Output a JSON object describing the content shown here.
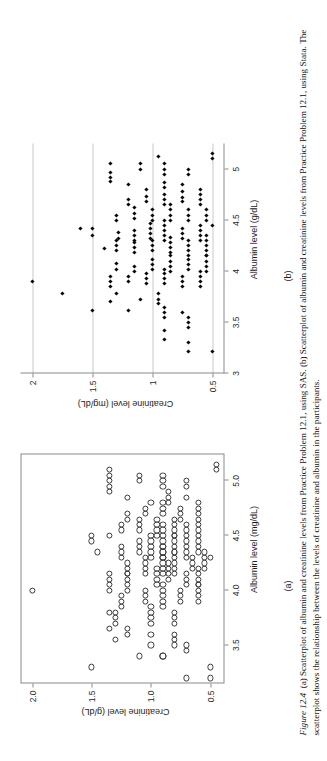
{
  "figure": {
    "number_label": "Figure 12.4",
    "caption_part_a": "(a) Scatterplot of albumin and creatinine levels from Practice Problem 12.1, using SAS.",
    "caption_part_b": "(b) Scatterplot of albumin and creatinine levels from Practice Problem 12.1, using Stata.",
    "caption_note": "The scatterplot shows the relationship between the levels of creatinine and albumin in the participants.",
    "sublabel_a": "(a)",
    "sublabel_b": "(b)"
  },
  "chart_data": [
    {
      "id": "panel-a",
      "type": "scatter",
      "software": "SAS",
      "title": "",
      "xlabel": "Albumin level (mg/dL)",
      "ylabel": "Creatinine level (g/dL)",
      "xlim": [
        3.15,
        5.25
      ],
      "ylim": [
        0.38,
        2.1
      ],
      "xticks": [
        3.5,
        4.0,
        4.5,
        5.0
      ],
      "xticklabels": [
        "3.5",
        "4.0",
        "4.5",
        "5.0"
      ],
      "yticks": [
        0.5,
        1.0,
        1.5,
        2.0
      ],
      "yticklabels": [
        "0.5",
        "1.0",
        "1.5",
        "2.0"
      ],
      "grid": false,
      "frame": "box",
      "marker": "open-circle",
      "legend": "none",
      "points": [
        [
          3.2,
          0.5
        ],
        [
          3.3,
          0.5
        ],
        [
          3.2,
          0.7
        ],
        [
          3.4,
          0.9
        ],
        [
          3.4,
          0.9
        ],
        [
          3.45,
          0.7
        ],
        [
          3.5,
          0.7
        ],
        [
          3.3,
          1.5
        ],
        [
          3.4,
          1.1
        ],
        [
          3.5,
          0.8
        ],
        [
          3.55,
          0.8
        ],
        [
          3.6,
          0.8
        ],
        [
          3.5,
          1.0
        ],
        [
          3.6,
          1.0
        ],
        [
          3.6,
          1.2
        ],
        [
          3.65,
          1.2
        ],
        [
          3.55,
          1.3
        ],
        [
          3.7,
          0.8
        ],
        [
          3.75,
          0.8
        ],
        [
          3.8,
          0.8
        ],
        [
          3.7,
          1.0
        ],
        [
          3.75,
          1.0
        ],
        [
          3.8,
          1.0
        ],
        [
          3.85,
          1.0
        ],
        [
          3.7,
          1.3
        ],
        [
          3.75,
          1.3
        ],
        [
          3.8,
          1.3
        ],
        [
          3.65,
          1.35
        ],
        [
          3.9,
          0.6
        ],
        [
          3.95,
          0.6
        ],
        [
          4.0,
          0.6
        ],
        [
          4.05,
          0.6
        ],
        [
          3.9,
          0.75
        ],
        [
          3.95,
          0.75
        ],
        [
          4.0,
          0.75
        ],
        [
          3.85,
          0.9
        ],
        [
          3.9,
          0.9
        ],
        [
          3.95,
          0.9
        ],
        [
          4.0,
          0.9
        ],
        [
          4.05,
          0.9
        ],
        [
          3.9,
          1.05
        ],
        [
          3.95,
          1.05
        ],
        [
          4.0,
          1.05
        ],
        [
          3.85,
          1.25
        ],
        [
          3.9,
          1.25
        ],
        [
          3.95,
          1.25
        ],
        [
          3.8,
          1.35
        ],
        [
          4.0,
          2.0
        ],
        [
          4.05,
          0.6
        ],
        [
          4.1,
          0.6
        ],
        [
          4.15,
          0.6
        ],
        [
          4.2,
          0.6
        ],
        [
          4.05,
          0.7
        ],
        [
          4.1,
          0.7
        ],
        [
          4.15,
          0.7
        ],
        [
          4.1,
          0.85
        ],
        [
          4.15,
          0.85
        ],
        [
          4.2,
          0.85
        ],
        [
          4.25,
          0.85
        ],
        [
          4.05,
          0.95
        ],
        [
          4.1,
          0.95
        ],
        [
          4.15,
          0.95
        ],
        [
          4.2,
          0.95
        ],
        [
          4.0,
          1.2
        ],
        [
          4.05,
          1.2
        ],
        [
          4.1,
          1.2
        ],
        [
          4.15,
          1.2
        ],
        [
          4.0,
          1.35
        ],
        [
          4.05,
          1.35
        ],
        [
          4.2,
          0.55
        ],
        [
          4.25,
          0.55
        ],
        [
          4.3,
          0.55
        ],
        [
          4.35,
          0.55
        ],
        [
          4.2,
          0.65
        ],
        [
          4.25,
          0.65
        ],
        [
          4.3,
          0.65
        ],
        [
          4.15,
          0.8
        ],
        [
          4.2,
          0.8
        ],
        [
          4.25,
          0.8
        ],
        [
          4.3,
          0.8
        ],
        [
          4.35,
          0.8
        ],
        [
          4.15,
          0.9
        ],
        [
          4.2,
          0.9
        ],
        [
          4.25,
          0.9
        ],
        [
          4.3,
          0.9
        ],
        [
          4.35,
          0.9
        ],
        [
          4.4,
          0.9
        ],
        [
          4.15,
          1.05
        ],
        [
          4.2,
          1.05
        ],
        [
          4.25,
          1.05
        ],
        [
          4.3,
          1.05
        ],
        [
          4.15,
          1.2
        ],
        [
          4.2,
          1.2
        ],
        [
          4.25,
          1.2
        ],
        [
          4.1,
          1.35
        ],
        [
          4.15,
          1.35
        ],
        [
          4.3,
          0.5
        ],
        [
          4.35,
          0.6
        ],
        [
          4.4,
          0.6
        ],
        [
          4.45,
          0.6
        ],
        [
          4.3,
          0.7
        ],
        [
          4.35,
          0.7
        ],
        [
          4.4,
          0.7
        ],
        [
          4.45,
          0.7
        ],
        [
          4.35,
          0.8
        ],
        [
          4.4,
          0.8
        ],
        [
          4.45,
          0.8
        ],
        [
          4.5,
          0.8
        ],
        [
          4.3,
          0.9
        ],
        [
          4.35,
          0.9
        ],
        [
          4.4,
          0.9
        ],
        [
          4.45,
          0.9
        ],
        [
          4.5,
          0.9
        ],
        [
          4.55,
          0.9
        ],
        [
          4.6,
          0.9
        ],
        [
          4.3,
          1.0
        ],
        [
          4.35,
          1.0
        ],
        [
          4.4,
          1.0
        ],
        [
          4.45,
          1.0
        ],
        [
          4.5,
          1.0
        ],
        [
          4.35,
          1.1
        ],
        [
          4.4,
          1.1
        ],
        [
          4.45,
          1.1
        ],
        [
          4.3,
          1.25
        ],
        [
          4.35,
          1.25
        ],
        [
          4.4,
          1.25
        ],
        [
          4.35,
          1.45
        ],
        [
          4.45,
          1.5
        ],
        [
          4.5,
          1.5
        ],
        [
          4.5,
          0.6
        ],
        [
          4.55,
          0.6
        ],
        [
          4.6,
          0.6
        ],
        [
          4.5,
          0.7
        ],
        [
          4.55,
          0.7
        ],
        [
          4.6,
          0.7
        ],
        [
          4.5,
          0.8
        ],
        [
          4.55,
          0.8
        ],
        [
          4.6,
          0.8
        ],
        [
          4.65,
          0.8
        ],
        [
          4.5,
          0.95
        ],
        [
          4.55,
          0.95
        ],
        [
          4.6,
          0.95
        ],
        [
          4.65,
          0.95
        ],
        [
          4.55,
          1.1
        ],
        [
          4.6,
          1.1
        ],
        [
          4.65,
          1.1
        ],
        [
          4.55,
          1.25
        ],
        [
          4.6,
          1.25
        ],
        [
          4.5,
          1.35
        ],
        [
          4.65,
          0.6
        ],
        [
          4.7,
          0.6
        ],
        [
          4.75,
          0.6
        ],
        [
          4.65,
          0.75
        ],
        [
          4.7,
          0.75
        ],
        [
          4.75,
          0.75
        ],
        [
          4.7,
          0.9
        ],
        [
          4.75,
          0.9
        ],
        [
          4.8,
          0.9
        ],
        [
          4.7,
          1.05
        ],
        [
          4.75,
          1.05
        ],
        [
          4.65,
          1.2
        ],
        [
          4.7,
          1.2
        ],
        [
          4.8,
          0.6
        ],
        [
          4.85,
          0.7
        ],
        [
          4.8,
          0.85
        ],
        [
          4.85,
          0.85
        ],
        [
          4.9,
          0.85
        ],
        [
          4.8,
          1.0
        ],
        [
          4.85,
          1.2
        ],
        [
          4.9,
          1.35
        ],
        [
          4.95,
          1.35
        ],
        [
          5.0,
          1.35
        ],
        [
          4.95,
          0.7
        ],
        [
          5.0,
          0.7
        ],
        [
          4.95,
          0.9
        ],
        [
          5.0,
          0.9
        ],
        [
          5.05,
          0.9
        ],
        [
          5.0,
          1.1
        ],
        [
          5.05,
          1.1
        ],
        [
          5.1,
          0.45
        ],
        [
          5.15,
          0.45
        ],
        [
          5.1,
          1.35
        ],
        [
          5.05,
          1.35
        ]
      ]
    },
    {
      "id": "panel-b",
      "type": "scatter",
      "software": "Stata",
      "title": "",
      "xlabel": "Albumin level (g/dL)",
      "ylabel": "Creatinine level (mg/dL)",
      "xlim": [
        3.0,
        5.25
      ],
      "ylim": [
        0.4,
        2.1
      ],
      "xticks": [
        3,
        3.5,
        4,
        4.5,
        5
      ],
      "xticklabels": [
        "3",
        "3.5",
        "4",
        "4.5",
        "5"
      ],
      "yticks": [
        0.5,
        1,
        1.5,
        2
      ],
      "yticklabels": [
        "0.5",
        "1",
        "1.5",
        "2"
      ],
      "grid": true,
      "grid_orientation": "horizontal",
      "frame": "left-bottom",
      "marker": "filled-diamond",
      "legend": "none",
      "points": [
        [
          3.22,
          0.5
        ],
        [
          3.3,
          0.7
        ],
        [
          3.22,
          0.7
        ],
        [
          3.33,
          0.9
        ],
        [
          3.45,
          0.7
        ],
        [
          3.5,
          0.7
        ],
        [
          3.55,
          0.7
        ],
        [
          3.42,
          0.9
        ],
        [
          3.55,
          0.9
        ],
        [
          3.6,
          0.9
        ],
        [
          3.65,
          0.9
        ],
        [
          3.6,
          0.75
        ],
        [
          3.62,
          1.2
        ],
        [
          3.7,
          1.35
        ],
        [
          3.62,
          1.5
        ],
        [
          3.68,
          0.95
        ],
        [
          3.72,
          0.95
        ],
        [
          3.78,
          0.95
        ],
        [
          3.72,
          1.1
        ],
        [
          3.78,
          1.3
        ],
        [
          3.85,
          0.6
        ],
        [
          3.9,
          0.6
        ],
        [
          3.95,
          0.6
        ],
        [
          4.0,
          0.6
        ],
        [
          3.85,
          0.75
        ],
        [
          3.9,
          0.75
        ],
        [
          3.95,
          0.75
        ],
        [
          3.88,
          0.9
        ],
        [
          3.93,
          0.9
        ],
        [
          3.98,
          0.9
        ],
        [
          4.02,
          0.9
        ],
        [
          3.88,
          1.05
        ],
        [
          3.93,
          1.05
        ],
        [
          3.98,
          1.05
        ],
        [
          3.9,
          1.2
        ],
        [
          3.95,
          1.2
        ],
        [
          3.85,
          1.35
        ],
        [
          3.9,
          1.35
        ],
        [
          3.95,
          1.35
        ],
        [
          3.9,
          2.0
        ],
        [
          3.78,
          1.75
        ],
        [
          4.0,
          0.55
        ],
        [
          4.05,
          0.55
        ],
        [
          4.1,
          0.55
        ],
        [
          4.15,
          0.55
        ],
        [
          4.02,
          0.7
        ],
        [
          4.07,
          0.7
        ],
        [
          4.12,
          0.7
        ],
        [
          4.0,
          0.85
        ],
        [
          4.05,
          0.85
        ],
        [
          4.1,
          0.85
        ],
        [
          4.15,
          0.85
        ],
        [
          4.02,
          1.0
        ],
        [
          4.07,
          1.0
        ],
        [
          4.12,
          1.0
        ],
        [
          4.0,
          1.15
        ],
        [
          4.05,
          1.15
        ],
        [
          4.02,
          1.3
        ],
        [
          4.08,
          1.3
        ],
        [
          4.15,
          0.55
        ],
        [
          4.2,
          0.55
        ],
        [
          4.25,
          0.55
        ],
        [
          4.3,
          0.55
        ],
        [
          4.35,
          0.55
        ],
        [
          4.15,
          0.7
        ],
        [
          4.2,
          0.7
        ],
        [
          4.25,
          0.7
        ],
        [
          4.3,
          0.7
        ],
        [
          4.18,
          0.85
        ],
        [
          4.23,
          0.85
        ],
        [
          4.28,
          0.85
        ],
        [
          4.33,
          0.85
        ],
        [
          4.2,
          1.0
        ],
        [
          4.25,
          1.0
        ],
        [
          4.3,
          1.0
        ],
        [
          4.18,
          1.15
        ],
        [
          4.23,
          1.15
        ],
        [
          4.28,
          1.15
        ],
        [
          4.2,
          1.3
        ],
        [
          4.25,
          1.3
        ],
        [
          4.3,
          1.3
        ],
        [
          4.22,
          1.4
        ],
        [
          4.3,
          0.6
        ],
        [
          4.35,
          0.6
        ],
        [
          4.4,
          0.6
        ],
        [
          4.45,
          0.6
        ],
        [
          4.32,
          0.75
        ],
        [
          4.37,
          0.75
        ],
        [
          4.42,
          0.75
        ],
        [
          4.3,
          0.9
        ],
        [
          4.35,
          0.9
        ],
        [
          4.4,
          0.9
        ],
        [
          4.45,
          0.9
        ],
        [
          4.5,
          0.9
        ],
        [
          4.32,
          1.02
        ],
        [
          4.37,
          1.02
        ],
        [
          4.42,
          1.02
        ],
        [
          4.47,
          1.02
        ],
        [
          4.3,
          1.15
        ],
        [
          4.35,
          1.15
        ],
        [
          4.4,
          1.15
        ],
        [
          4.32,
          1.28
        ],
        [
          4.38,
          1.28
        ],
        [
          4.35,
          1.5
        ],
        [
          4.42,
          1.5
        ],
        [
          4.42,
          1.6
        ],
        [
          4.45,
          0.5
        ],
        [
          4.5,
          0.55
        ],
        [
          4.55,
          0.55
        ],
        [
          4.6,
          0.55
        ],
        [
          4.5,
          0.7
        ],
        [
          4.55,
          0.7
        ],
        [
          4.6,
          0.7
        ],
        [
          4.5,
          0.85
        ],
        [
          4.55,
          0.85
        ],
        [
          4.6,
          0.85
        ],
        [
          4.65,
          0.85
        ],
        [
          4.5,
          1.0
        ],
        [
          4.55,
          1.0
        ],
        [
          4.6,
          1.0
        ],
        [
          4.52,
          1.15
        ],
        [
          4.57,
          1.15
        ],
        [
          4.62,
          1.15
        ],
        [
          4.5,
          1.3
        ],
        [
          4.55,
          1.3
        ],
        [
          4.65,
          0.6
        ],
        [
          4.7,
          0.6
        ],
        [
          4.75,
          0.6
        ],
        [
          4.68,
          0.75
        ],
        [
          4.72,
          0.75
        ],
        [
          4.78,
          0.75
        ],
        [
          4.65,
          0.9
        ],
        [
          4.7,
          0.9
        ],
        [
          4.75,
          0.9
        ],
        [
          4.68,
          1.05
        ],
        [
          4.73,
          1.05
        ],
        [
          4.65,
          1.2
        ],
        [
          4.7,
          1.2
        ],
        [
          4.8,
          0.6
        ],
        [
          4.85,
          0.75
        ],
        [
          4.82,
          0.9
        ],
        [
          4.87,
          0.9
        ],
        [
          4.8,
          1.05
        ],
        [
          4.85,
          1.2
        ],
        [
          4.88,
          1.35
        ],
        [
          4.92,
          1.35
        ],
        [
          4.97,
          1.35
        ],
        [
          4.95,
          0.7
        ],
        [
          5.0,
          0.7
        ],
        [
          4.95,
          0.9
        ],
        [
          5.0,
          0.9
        ],
        [
          5.05,
          0.9
        ],
        [
          5.0,
          1.1
        ],
        [
          5.05,
          1.1
        ],
        [
          5.1,
          0.5
        ],
        [
          5.15,
          0.5
        ],
        [
          5.12,
          0.95
        ],
        [
          5.05,
          1.35
        ]
      ]
    }
  ]
}
